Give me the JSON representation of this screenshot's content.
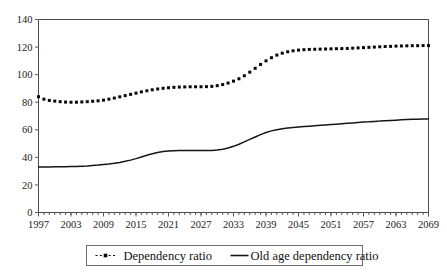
{
  "chart_data": {
    "type": "line",
    "title": "",
    "subtitle": "",
    "xlabel": "",
    "ylabel": "",
    "xlim": [
      1997,
      2069
    ],
    "ylim": [
      0,
      140
    ],
    "ytick_labels": [
      "0",
      "20",
      "40",
      "60",
      "80",
      "100",
      "120",
      "140"
    ],
    "ytick_values": [
      0,
      20,
      40,
      60,
      80,
      100,
      120,
      140
    ],
    "xtick_labels": [
      "1997",
      "2003",
      "2009",
      "2015",
      "2021",
      "2027",
      "2033",
      "2039",
      "2045",
      "2051",
      "2057",
      "2063",
      "2069"
    ],
    "xtick_values": [
      1997,
      2003,
      2009,
      2015,
      2021,
      2027,
      2033,
      2039,
      2045,
      2051,
      2057,
      2063,
      2069
    ],
    "minor_tick_interval": 1,
    "grid": false,
    "legend_position": "bottom-center",
    "x": [
      1997,
      1998,
      1999,
      2000,
      2001,
      2002,
      2003,
      2004,
      2005,
      2006,
      2007,
      2008,
      2009,
      2010,
      2011,
      2012,
      2013,
      2014,
      2015,
      2016,
      2017,
      2018,
      2019,
      2020,
      2021,
      2022,
      2023,
      2024,
      2025,
      2026,
      2027,
      2028,
      2029,
      2030,
      2031,
      2032,
      2033,
      2034,
      2035,
      2036,
      2037,
      2038,
      2039,
      2040,
      2041,
      2042,
      2043,
      2044,
      2045,
      2046,
      2047,
      2048,
      2049,
      2050,
      2051,
      2052,
      2053,
      2054,
      2055,
      2056,
      2057,
      2058,
      2059,
      2060,
      2061,
      2062,
      2063,
      2064,
      2065,
      2066,
      2067,
      2068,
      2069
    ],
    "series": [
      {
        "name": "Dependency ratio",
        "style": "dotted-markers",
        "color": "#080808",
        "marker": "square",
        "values": [
          84.0,
          82.2,
          81.3,
          80.8,
          80.4,
          80.1,
          80.0,
          80.0,
          80.2,
          80.4,
          80.7,
          81.0,
          81.5,
          82.2,
          83.0,
          83.9,
          84.8,
          85.7,
          86.6,
          87.5,
          88.3,
          89.0,
          89.6,
          90.1,
          90.5,
          90.8,
          91.0,
          91.1,
          91.2,
          91.2,
          91.2,
          91.3,
          91.5,
          92.0,
          92.8,
          93.9,
          95.3,
          97.0,
          99.2,
          101.8,
          104.6,
          107.4,
          110.0,
          112.3,
          114.2,
          115.6,
          116.6,
          117.3,
          117.8,
          118.1,
          118.3,
          118.4,
          118.5,
          118.6,
          118.7,
          118.8,
          118.9,
          119.0,
          119.2,
          119.4,
          119.6,
          119.8,
          120.0,
          120.2,
          120.4,
          120.5,
          120.7,
          120.8,
          120.9,
          121.0,
          121.0,
          121.1,
          121.1
        ]
      },
      {
        "name": "Old age dependency ratio",
        "style": "solid",
        "color": "#151515",
        "marker": "none",
        "values": [
          33.0,
          33.0,
          33.0,
          33.1,
          33.1,
          33.2,
          33.3,
          33.4,
          33.6,
          33.8,
          34.1,
          34.4,
          34.8,
          35.2,
          35.7,
          36.3,
          37.1,
          38.0,
          39.1,
          40.3,
          41.5,
          42.6,
          43.5,
          44.2,
          44.6,
          44.8,
          44.9,
          45.0,
          45.0,
          45.0,
          44.9,
          44.9,
          45.0,
          45.3,
          45.9,
          46.8,
          48.0,
          49.5,
          51.2,
          53.0,
          54.8,
          56.5,
          58.0,
          59.2,
          60.1,
          60.8,
          61.3,
          61.7,
          62.0,
          62.3,
          62.6,
          62.9,
          63.2,
          63.5,
          63.8,
          64.1,
          64.4,
          64.7,
          65.0,
          65.3,
          65.6,
          65.8,
          66.1,
          66.3,
          66.6,
          66.8,
          67.0,
          67.2,
          67.4,
          67.6,
          67.7,
          67.8,
          67.9
        ]
      }
    ]
  },
  "legend": {
    "items": [
      {
        "label": "Dependency ratio",
        "swatch": "dotted-square-marker"
      },
      {
        "label": "Old age dependency ratio",
        "swatch": "solid-line"
      }
    ]
  },
  "colors": {
    "series_primary": "#080808",
    "series_secondary": "#151515",
    "frame": "#4c4c4c",
    "background": "#ffffff",
    "text": "#1a1a1a"
  }
}
